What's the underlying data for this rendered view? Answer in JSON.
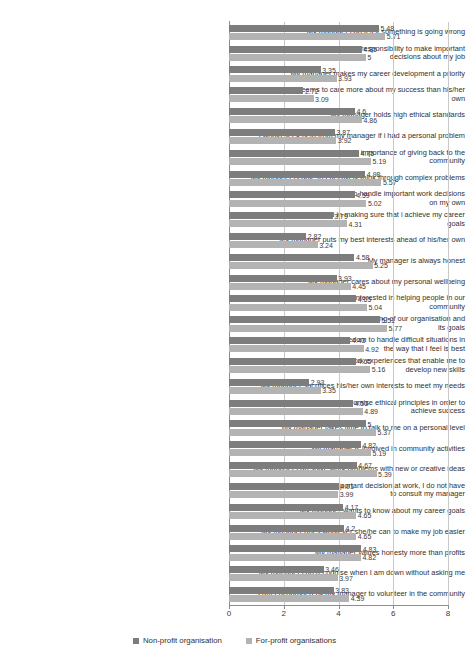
{
  "chart_data": {
    "type": "bar",
    "orientation": "horizontal",
    "title": "",
    "xlabel": "",
    "ylabel": "",
    "xlim": [
      0,
      8
    ],
    "xticks": [
      0,
      2,
      4,
      6,
      8
    ],
    "grid": true,
    "legend_position": "bottom",
    "categories": [
      "My manager can tell if something is going wrong",
      "My manager gives me the responsibility to make important decisions about my job",
      "My manager makes my career development a priority",
      "My manager seems to care more about my success than his/her own",
      "My manager holds high ethical standards",
      "I would seek help from my manager if i had a personal problem",
      "My manager emphasises the importance of giving back to the community",
      "My manager is able to effectively think through complex problems",
      "My manager encourages me to handle important work decisions on my own",
      "My manager is interested in making sure that i achieve my career goals",
      "My manager puts my best interests ahead of his/her own",
      "My manager is always honest",
      "My manager cares about my personal wellbeing",
      "My manager is always interested in helping people in our community",
      "My manager has a thorough understanding of our organisation and its goals",
      "My manager gives me the freedom to handle difficult situations in the way that I feel is best",
      "My manager provides me with work experiences that enable me to develop new skills",
      "My manager sacrifices his/her own interests to meet my needs",
      "My manager would not compromise ethical principles in order to achieve success",
      "My manager takes time to talk to me on a personal level",
      "My manager is involved in community activities",
      "My manager can solve work problems with new or creative ideas",
      "When I have to make an important decision at work, I do not have to consult my manager",
      "My manager wants to know about my career goals",
      "My manager does whatever she/he can to make my job easier",
      "My manager values honesty more than profits",
      "My manager can recognise when I am down without asking me",
      "I am encouraged by my manager to volunteer in the community"
    ],
    "series": [
      {
        "name": "Non-profit organisation",
        "color": "#7d7d7d",
        "values": [
          5.48,
          4.85,
          3.35,
          2.72,
          4.6,
          3.87,
          4.75,
          4.98,
          4.59,
          3.79,
          2.82,
          4.58,
          3.93,
          4.65,
          5.51,
          4.43,
          4.65,
          2.93,
          4.53,
          5,
          4.82,
          4.67,
          4.01,
          4.17,
          4.2,
          4.83,
          3.46,
          3.83
        ],
        "labels": [
          "5.48",
          "4.85",
          "3.35",
          "2.72",
          "4.6",
          "3.87",
          "4.75",
          "4.98",
          "4.59",
          "3.79",
          "2.82",
          "4.58",
          "3.93",
          "4.65",
          "5.51",
          "4.43",
          "4.65",
          "2.93",
          "4.53",
          "5",
          "4.82",
          "4.67",
          "4.01",
          "4.17",
          "4.2",
          "4.83",
          "3.46",
          "3.83"
        ]
      },
      {
        "name": "For-profit organisations",
        "color": "#b3b3b3",
        "values": [
          5.71,
          5,
          3.93,
          3.09,
          4.86,
          3.92,
          5.19,
          5.57,
          5.02,
          4.31,
          3.24,
          5.25,
          4.45,
          5.04,
          5.77,
          4.92,
          5.16,
          3.35,
          4.89,
          5.37,
          5.19,
          5.39,
          3.99,
          4.65,
          4.65,
          4.82,
          3.97,
          4.39
        ],
        "labels": [
          "5.71",
          "5",
          "3.93",
          "3.09",
          "4.86",
          "3.92",
          "5.19",
          "5.57",
          "5.02",
          "4.31",
          "3.24",
          "5.25",
          "4.45",
          "5.04",
          "5.77",
          "4.92",
          "5.16",
          "3.35",
          "4.89",
          "5.37",
          "5.19",
          "5.39",
          "3.99",
          "4.65",
          "4.65",
          "4.82",
          "3.97",
          "4.39"
        ]
      }
    ]
  },
  "legend": {
    "items": [
      {
        "label": "Non-profit organisation",
        "color": "#7d7d7d"
      },
      {
        "label": "For-profit organisations",
        "color": "#b3b3b3"
      }
    ]
  },
  "axis": {
    "x_tick_labels": [
      "0",
      "2",
      "4",
      "6",
      "8"
    ]
  }
}
